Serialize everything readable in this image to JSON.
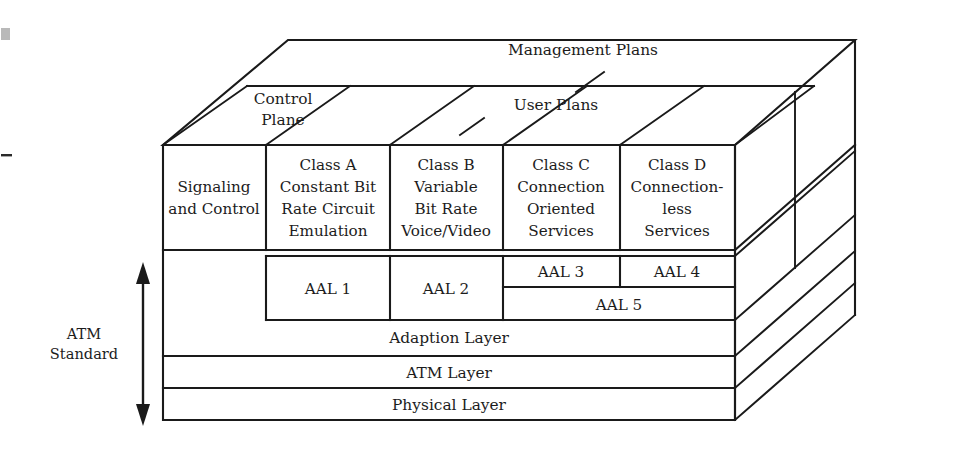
{
  "figure": {
    "title_text": "",
    "planes": {
      "management": "Management Plans",
      "user": "User Plans",
      "control_line1": "Control",
      "control_line2": "Plane"
    },
    "side_label": {
      "line1": "ATM",
      "line2": "Standard"
    },
    "columns": [
      {
        "name": "signaling",
        "lines": [
          "Signaling",
          "and Control"
        ]
      },
      {
        "name": "class-a",
        "lines": [
          "Class A",
          "Constant Bit",
          "Rate Circuit",
          "Emulation"
        ]
      },
      {
        "name": "class-b",
        "lines": [
          "Class B",
          "Variable",
          "Bit Rate",
          "Voice/Video"
        ]
      },
      {
        "name": "class-c",
        "lines": [
          "Class C",
          "Connection",
          "Oriented",
          "Services"
        ]
      },
      {
        "name": "class-d",
        "lines": [
          "Class D",
          "Connection-",
          "less",
          "Services"
        ]
      }
    ],
    "aal": {
      "aal1": "AAL 1",
      "aal2": "AAL 2",
      "aal3": "AAL 3",
      "aal4": "AAL 4",
      "aal5": "AAL 5"
    },
    "layers": {
      "adaption": "Adaption Layer",
      "atm": "ATM Layer",
      "physical": "Physical Layer"
    },
    "colors": {
      "stroke": "#1a1a1a",
      "face": "#ffffff",
      "text": "#1c1c1c",
      "background": "#ffffff"
    }
  }
}
